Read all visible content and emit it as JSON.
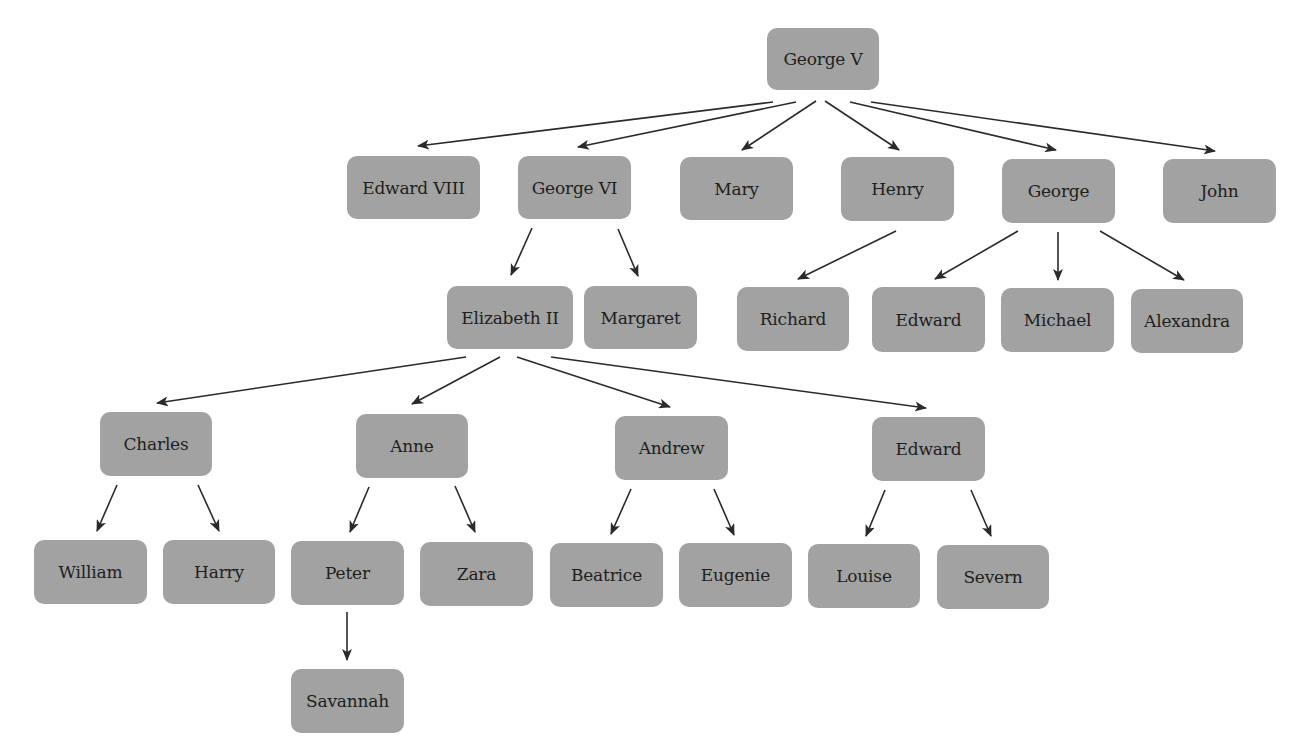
{
  "diagram": {
    "node_color": "#a2a2a2",
    "edge_color": "#2a2a2a",
    "nodes": [
      {
        "id": "george-v",
        "label": "George V",
        "x": 767,
        "y": 28,
        "w": 112,
        "h": 62
      },
      {
        "id": "edward-viii",
        "label": "Edward VIII",
        "x": 347,
        "y": 156,
        "w": 133,
        "h": 63
      },
      {
        "id": "george-vi",
        "label": "George VI",
        "x": 518,
        "y": 156,
        "w": 113,
        "h": 63
      },
      {
        "id": "mary",
        "label": "Mary",
        "x": 680,
        "y": 157,
        "w": 113,
        "h": 63
      },
      {
        "id": "henry",
        "label": "Henry",
        "x": 841,
        "y": 157,
        "w": 113,
        "h": 64
      },
      {
        "id": "george",
        "label": "George",
        "x": 1002,
        "y": 159,
        "w": 113,
        "h": 64
      },
      {
        "id": "john",
        "label": "John",
        "x": 1163,
        "y": 159,
        "w": 113,
        "h": 64
      },
      {
        "id": "elizabeth-ii",
        "label": "Elizabeth II",
        "x": 447,
        "y": 286,
        "w": 126,
        "h": 63
      },
      {
        "id": "margaret",
        "label": "Margaret",
        "x": 584,
        "y": 286,
        "w": 113,
        "h": 63
      },
      {
        "id": "richard",
        "label": "Richard",
        "x": 737,
        "y": 287,
        "w": 112,
        "h": 64
      },
      {
        "id": "edward-kent",
        "label": "Edward",
        "x": 872,
        "y": 287,
        "w": 113,
        "h": 65
      },
      {
        "id": "michael",
        "label": "Michael",
        "x": 1001,
        "y": 288,
        "w": 113,
        "h": 64
      },
      {
        "id": "alexandra",
        "label": "Alexandra",
        "x": 1131,
        "y": 289,
        "w": 112,
        "h": 64
      },
      {
        "id": "charles",
        "label": "Charles",
        "x": 100,
        "y": 412,
        "w": 112,
        "h": 64
      },
      {
        "id": "anne",
        "label": "Anne",
        "x": 356,
        "y": 414,
        "w": 112,
        "h": 64
      },
      {
        "id": "andrew",
        "label": "Andrew",
        "x": 615,
        "y": 416,
        "w": 113,
        "h": 64
      },
      {
        "id": "edward",
        "label": "Edward",
        "x": 872,
        "y": 417,
        "w": 113,
        "h": 64
      },
      {
        "id": "william",
        "label": "William",
        "x": 34,
        "y": 540,
        "w": 113,
        "h": 64
      },
      {
        "id": "harry",
        "label": "Harry",
        "x": 163,
        "y": 540,
        "w": 112,
        "h": 64
      },
      {
        "id": "peter",
        "label": "Peter",
        "x": 291,
        "y": 541,
        "w": 113,
        "h": 64
      },
      {
        "id": "zara",
        "label": "Zara",
        "x": 420,
        "y": 542,
        "w": 113,
        "h": 64
      },
      {
        "id": "beatrice",
        "label": "Beatrice",
        "x": 550,
        "y": 543,
        "w": 113,
        "h": 64
      },
      {
        "id": "eugenie",
        "label": "Eugenie",
        "x": 679,
        "y": 543,
        "w": 113,
        "h": 64
      },
      {
        "id": "louise",
        "label": "Louise",
        "x": 808,
        "y": 544,
        "w": 112,
        "h": 64
      },
      {
        "id": "severn",
        "label": "Severn",
        "x": 937,
        "y": 545,
        "w": 112,
        "h": 64
      },
      {
        "id": "savannah",
        "label": "Savannah",
        "x": 291,
        "y": 669,
        "w": 113,
        "h": 64
      }
    ],
    "edges": [
      {
        "from": "george-v",
        "to": "edward-viii",
        "x1": 773,
        "y1": 102,
        "x2": 418,
        "y2": 146
      },
      {
        "from": "george-v",
        "to": "george-vi",
        "x1": 796,
        "y1": 102,
        "x2": 578,
        "y2": 147
      },
      {
        "from": "george-v",
        "to": "mary",
        "x1": 816,
        "y1": 101,
        "x2": 742,
        "y2": 150
      },
      {
        "from": "george-v",
        "to": "henry",
        "x1": 825,
        "y1": 101,
        "x2": 899,
        "y2": 150
      },
      {
        "from": "george-v",
        "to": "george",
        "x1": 850,
        "y1": 102,
        "x2": 1056,
        "y2": 150
      },
      {
        "from": "george-v",
        "to": "john",
        "x1": 871,
        "y1": 102,
        "x2": 1215,
        "y2": 151
      },
      {
        "from": "george-vi",
        "to": "elizabeth-ii",
        "x1": 532,
        "y1": 228,
        "x2": 511,
        "y2": 275
      },
      {
        "from": "george-vi",
        "to": "margaret",
        "x1": 618,
        "y1": 229,
        "x2": 638,
        "y2": 276
      },
      {
        "from": "henry",
        "to": "richard",
        "x1": 896,
        "y1": 231,
        "x2": 798,
        "y2": 279
      },
      {
        "from": "george",
        "to": "edward-kent",
        "x1": 1018,
        "y1": 231,
        "x2": 935,
        "y2": 279
      },
      {
        "from": "george",
        "to": "michael",
        "x1": 1058,
        "y1": 232,
        "x2": 1058,
        "y2": 280
      },
      {
        "from": "george",
        "to": "alexandra",
        "x1": 1100,
        "y1": 231,
        "x2": 1184,
        "y2": 280
      },
      {
        "from": "elizabeth-ii",
        "to": "charles",
        "x1": 466,
        "y1": 357,
        "x2": 157,
        "y2": 403
      },
      {
        "from": "elizabeth-ii",
        "to": "anne",
        "x1": 500,
        "y1": 357,
        "x2": 412,
        "y2": 404
      },
      {
        "from": "elizabeth-ii",
        "to": "andrew",
        "x1": 517,
        "y1": 357,
        "x2": 670,
        "y2": 407
      },
      {
        "from": "elizabeth-ii",
        "to": "edward",
        "x1": 551,
        "y1": 357,
        "x2": 926,
        "y2": 408
      },
      {
        "from": "charles",
        "to": "william",
        "x1": 117,
        "y1": 485,
        "x2": 97,
        "y2": 531
      },
      {
        "from": "charles",
        "to": "harry",
        "x1": 198,
        "y1": 485,
        "x2": 219,
        "y2": 531
      },
      {
        "from": "anne",
        "to": "peter",
        "x1": 369,
        "y1": 487,
        "x2": 350,
        "y2": 532
      },
      {
        "from": "anne",
        "to": "zara",
        "x1": 455,
        "y1": 486,
        "x2": 475,
        "y2": 532
      },
      {
        "from": "andrew",
        "to": "beatrice",
        "x1": 631,
        "y1": 489,
        "x2": 611,
        "y2": 534
      },
      {
        "from": "andrew",
        "to": "eugenie",
        "x1": 714,
        "y1": 489,
        "x2": 734,
        "y2": 535
      },
      {
        "from": "edward",
        "to": "louise",
        "x1": 885,
        "y1": 490,
        "x2": 866,
        "y2": 536
      },
      {
        "from": "edward",
        "to": "severn",
        "x1": 971,
        "y1": 490,
        "x2": 991,
        "y2": 536
      },
      {
        "from": "peter",
        "to": "savannah",
        "x1": 347,
        "y1": 612,
        "x2": 347,
        "y2": 660
      }
    ]
  }
}
